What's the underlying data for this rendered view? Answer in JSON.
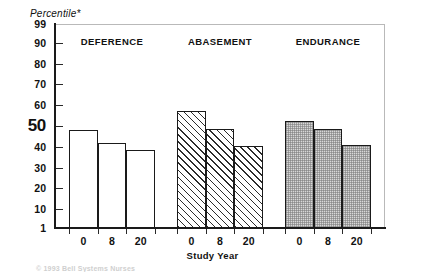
{
  "chart_data": {
    "type": "bar",
    "title": "",
    "subtitle": "",
    "ylabel": "Percentile*",
    "xlabel": "Study Year",
    "ylim": [
      1,
      99
    ],
    "grid": false,
    "legend_position": "none",
    "y_ticks": [
      "99",
      "90",
      "80",
      "70",
      "60",
      "50",
      "40",
      "30",
      "20",
      "10",
      "1"
    ],
    "y_tick_values": [
      99,
      90,
      80,
      70,
      60,
      50,
      40,
      30,
      20,
      10,
      1
    ],
    "emphasized_y_tick": "50",
    "categories": [
      "0",
      "8",
      "20"
    ],
    "category_label": "Study Year",
    "series": [
      {
        "name": "DEFERENCE",
        "fill": "plain",
        "values": [
          48,
          42,
          38.5
        ]
      },
      {
        "name": "ABASEMENT",
        "fill": "hatch",
        "values": [
          57,
          48.5,
          40.5
        ]
      },
      {
        "name": "ENDURANCE",
        "fill": "dots",
        "values": [
          52.5,
          48.5,
          41
        ]
      }
    ],
    "annotations": [],
    "footnote": "© 1993 Bell Systems Nurses"
  },
  "colors": {
    "axis": "#1a1a1a",
    "frame": "#b9b9b9",
    "bar_outline": "#1a1a1a",
    "bar_plain_fill": "#ffffff",
    "bar_hatch_fill": "#ffffff",
    "bar_dot_fill": "#d8d8d8",
    "text": "#111111",
    "footnote": "#cfcfcf"
  }
}
